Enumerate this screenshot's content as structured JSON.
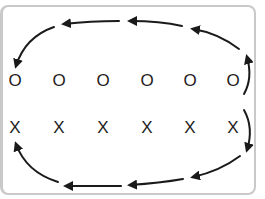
{
  "diagram": {
    "title": "",
    "top_row": {
      "symbol": "O",
      "count": 6,
      "labels": [
        "O",
        "O",
        "O",
        "O",
        "O",
        "O"
      ]
    },
    "bottom_row": {
      "symbol": "X",
      "count": 6,
      "labels": [
        "X",
        "X",
        "X",
        "X",
        "X",
        "X"
      ]
    },
    "flow": {
      "top_direction": "right-to-left",
      "bottom_direction": "right-to-left",
      "description": "Arrows circulate from the right end of each row, over (top) and under (bottom), back to the left end",
      "top_arrow_count": 5,
      "bottom_arrow_count": 5
    },
    "colors": {
      "frame_border": "#c9c9c9",
      "ink": "#1a1a1a",
      "background": "#ffffff"
    }
  }
}
